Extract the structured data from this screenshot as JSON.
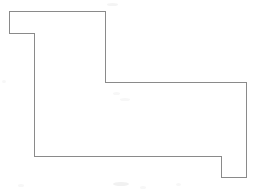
{
  "figure": {
    "title": "rectilinear-polygon-outline",
    "canvas": {
      "width": 256,
      "height": 194,
      "background_color": "#ffffff"
    },
    "stroke": {
      "color": "#8a8a8a",
      "width": 1,
      "linejoin": "miter",
      "linecap": "square",
      "fill": "none"
    },
    "shape": {
      "name": "orthogonal-polygon",
      "closed": true,
      "vertex_count": 10,
      "points": [
        [
          9,
          11
        ],
        [
          105,
          11
        ],
        [
          105,
          82
        ],
        [
          246,
          82
        ],
        [
          246,
          177
        ],
        [
          221,
          177
        ],
        [
          221,
          156
        ],
        [
          34,
          156
        ],
        [
          34,
          33
        ],
        [
          9,
          33
        ]
      ],
      "points_attr": "9,11 105,11 105,82 246,82 246,177 221,177 221,156 34,156 34,33 9,33",
      "edges": [
        {
          "name": "top-edge-upper-left-notch",
          "from": [
            9,
            11
          ],
          "to": [
            105,
            11
          ],
          "orientation": "horizontal",
          "length": 96
        },
        {
          "name": "right-edge-upper-block",
          "from": [
            105,
            11
          ],
          "to": [
            105,
            82
          ],
          "orientation": "vertical",
          "length": 71
        },
        {
          "name": "top-edge-right-wing",
          "from": [
            105,
            82
          ],
          "to": [
            246,
            82
          ],
          "orientation": "horizontal",
          "length": 141
        },
        {
          "name": "right-edge-outer",
          "from": [
            246,
            82
          ],
          "to": [
            246,
            177
          ],
          "orientation": "vertical",
          "length": 95
        },
        {
          "name": "bottom-edge-right-tab",
          "from": [
            246,
            177
          ],
          "to": [
            221,
            177
          ],
          "orientation": "horizontal",
          "length": 25
        },
        {
          "name": "inner-step-vertical",
          "from": [
            221,
            177
          ],
          "to": [
            221,
            156
          ],
          "orientation": "vertical",
          "length": 21
        },
        {
          "name": "bottom-edge-main",
          "from": [
            221,
            156
          ],
          "to": [
            34,
            156
          ],
          "orientation": "horizontal",
          "length": 187
        },
        {
          "name": "left-edge-main",
          "from": [
            34,
            156
          ],
          "to": [
            34,
            33
          ],
          "orientation": "vertical",
          "length": 123
        },
        {
          "name": "notch-bottom-edge",
          "from": [
            34,
            33
          ],
          "to": [
            9,
            33
          ],
          "orientation": "horizontal",
          "length": 25
        },
        {
          "name": "left-edge-notch",
          "from": [
            9,
            33
          ],
          "to": [
            9,
            11
          ],
          "orientation": "vertical",
          "length": 22
        }
      ]
    },
    "background_artifacts": [
      {
        "name": "speckle-top-center",
        "x": 107,
        "y": 3,
        "w": 11,
        "h": 3,
        "shade": "s1"
      },
      {
        "name": "speckle-mid-left",
        "x": 2,
        "y": 80,
        "w": 4,
        "h": 3,
        "shade": "s3"
      },
      {
        "name": "speckle-bottom-left",
        "x": 18,
        "y": 184,
        "w": 6,
        "h": 3,
        "shade": "s3"
      },
      {
        "name": "speckle-bottom-center",
        "x": 113,
        "y": 182,
        "w": 16,
        "h": 4,
        "shade": "s2"
      },
      {
        "name": "speckle-bottom-center-right",
        "x": 140,
        "y": 186,
        "w": 6,
        "h": 3,
        "shade": "s3"
      },
      {
        "name": "speckle-bottom-right",
        "x": 176,
        "y": 183,
        "w": 5,
        "h": 3,
        "shade": "s3"
      },
      {
        "name": "speckle-inner-a",
        "x": 113,
        "y": 92,
        "w": 7,
        "h": 3,
        "shade": "s3"
      },
      {
        "name": "speckle-inner-b",
        "x": 120,
        "y": 98,
        "w": 10,
        "h": 3,
        "shade": "s3"
      }
    ]
  }
}
